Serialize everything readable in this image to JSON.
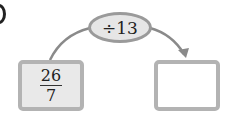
{
  "diagram": {
    "operation": {
      "label": "÷13"
    },
    "input": {
      "numerator": "26",
      "denominator": "7"
    },
    "output": {
      "value": ""
    }
  },
  "colors": {
    "box_border": "#b3b3b3",
    "oval_fill": "#e6e6e6",
    "arrow": "#888888"
  }
}
